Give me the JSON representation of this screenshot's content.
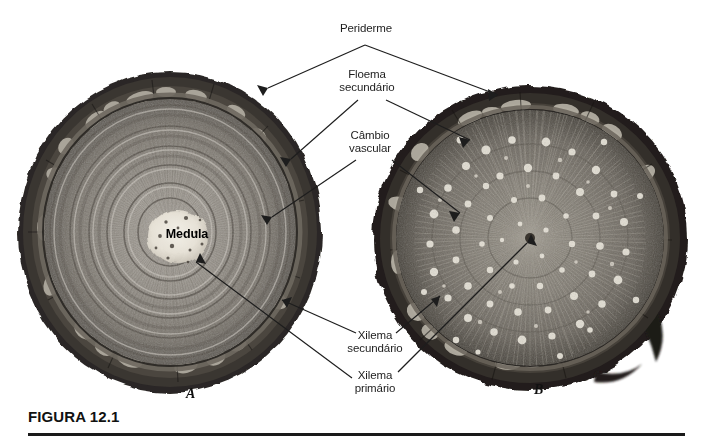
{
  "figure": {
    "caption_title": "FIGURA 12.1",
    "background_color": "#ffffff",
    "ink_color": "#1d1d1d"
  },
  "panels": [
    {
      "id": "A",
      "label": "A",
      "type": "conifer-stem-cross-section"
    },
    {
      "id": "B",
      "label": "B",
      "type": "woody-dicot-stem-cross-section"
    }
  ],
  "annotations": [
    {
      "name": "periderme",
      "text": "Periderme",
      "points_to": [
        "A-outer-bark",
        "B-outer-bark"
      ]
    },
    {
      "name": "floema-secundario",
      "text": "Floema\nsecundário",
      "points_to": [
        "A-phloem",
        "B-phloem"
      ]
    },
    {
      "name": "cambio-vascular",
      "text": "Câmbio\nvascular",
      "points_to": [
        "A-cambium",
        "B-cambium"
      ]
    },
    {
      "name": "xilema-secundario",
      "text": "Xilema\nsecundário",
      "points_to": [
        "A-secondary-xylem",
        "B-secondary-xylem"
      ]
    },
    {
      "name": "xilema-primario",
      "text": "Xilema\nprimário",
      "points_to": [
        "A-primary-xylem",
        "B-primary-xylem"
      ]
    },
    {
      "name": "medula",
      "text": "Medula",
      "points_to": [
        "A-pith"
      ]
    }
  ]
}
